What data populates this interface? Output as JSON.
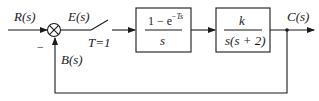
{
  "diagram": {
    "type": "closed-loop sampled-data control system block diagram",
    "signals": {
      "input": "R(s)",
      "error": "E(s)",
      "output": "C(s)",
      "feedback": "B(s)"
    },
    "summing_junction": {
      "feedback_sign": "−"
    },
    "sampler": {
      "label": "T=1"
    },
    "blocks": [
      {
        "id": "zoh",
        "numerator": "1 − e",
        "numerator_exp": "−Ts",
        "denominator": "s"
      },
      {
        "id": "plant",
        "numerator": "k",
        "denominator": "s(s + 2)"
      }
    ],
    "feedback": "unity"
  }
}
